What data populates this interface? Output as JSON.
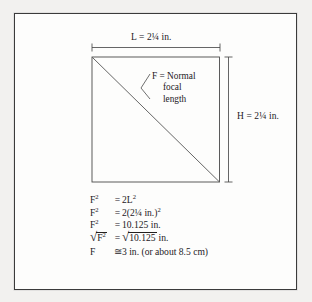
{
  "figure": {
    "background_color": "#f2f1ef",
    "paper_color": "#fdfdfc",
    "ink_color": "#24201e",
    "frame_color": "#3b3b3b"
  },
  "dimensions": {
    "length_label": "L = 2¼ in.",
    "height_label": "H = 2¼ in."
  },
  "callout": {
    "line1": "F = Normal",
    "line2": "focal",
    "line3": "length"
  },
  "equations": [
    {
      "lhs": "F",
      "lhs_sup": "2",
      "operator": "=",
      "rhs_pre": "2L",
      "rhs_sup": "2",
      "rhs_post": ""
    },
    {
      "lhs": "F",
      "lhs_sup": "2",
      "operator": "=",
      "rhs_pre": "2(2¼ in.)",
      "rhs_sup": "2",
      "rhs_post": ""
    },
    {
      "lhs": "F",
      "lhs_sup": "2",
      "operator": "=",
      "rhs_pre": "10.125 in.",
      "rhs_sup": "",
      "rhs_post": ""
    }
  ],
  "radical_row": {
    "lhs_radicand": "F",
    "lhs_radicand_sup": "2",
    "operator": "=",
    "rhs_radicand": "10.125",
    "rhs_unit": "in.",
    "radical_glyph": "√"
  },
  "result_row": {
    "lhs": "F",
    "approx_symbol": "≅",
    "rhs": "3 in. (or about 8.5 cm)"
  }
}
